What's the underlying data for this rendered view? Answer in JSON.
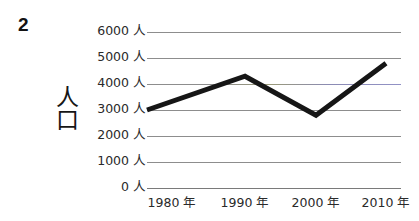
{
  "question_number": "2",
  "y_axis_title": "人口",
  "y_axis_title_chars": [
    "人",
    "口"
  ],
  "chart_data": {
    "type": "line",
    "title": "",
    "xlabel": "",
    "ylabel": "人口",
    "categories": [
      "1980 年",
      "1990 年",
      "2000 年",
      "2010 年"
    ],
    "x": [
      1980,
      1990,
      2000,
      2010
    ],
    "values": [
      3000,
      4300,
      2800,
      4800
    ],
    "unit": "人",
    "ylim": [
      0,
      6000
    ],
    "ytick_values": [
      6000,
      5000,
      4000,
      3000,
      2000,
      1000,
      0
    ],
    "ytick_labels": [
      "6000 人",
      "5000 人",
      "4000 人",
      "3000 人",
      "2000 人",
      "1000 人",
      "0 人"
    ],
    "grid": true,
    "grid_color": "#8d8d8d",
    "legend": null,
    "series": [
      {
        "name": "人口",
        "values": [
          3000,
          4300,
          2800,
          4800
        ],
        "color": "#161616",
        "line_width": 5
      }
    ],
    "annotations": []
  },
  "colors": {
    "line": "#161616",
    "grid": "#8d8d8d",
    "text": "#2a2a2a",
    "background": "#ffffff"
  }
}
